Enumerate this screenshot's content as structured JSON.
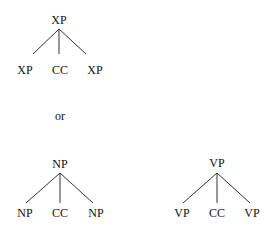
{
  "diagram": {
    "connector": "or",
    "trees": [
      {
        "id": "generic",
        "root": "XP",
        "children": [
          "XP",
          "CC",
          "XP"
        ]
      },
      {
        "id": "noun-coordination",
        "root": "NP",
        "children": [
          "NP",
          "CC",
          "NP"
        ]
      },
      {
        "id": "verb-coordination",
        "root": "VP",
        "children": [
          "VP",
          "CC",
          "VP"
        ]
      }
    ]
  }
}
